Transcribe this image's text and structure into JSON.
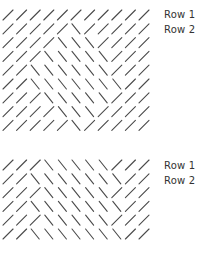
{
  "stroke_color": "#4a4a4a",
  "grids": [
    {
      "name": "top-grid",
      "top": 8,
      "rows": [
        "///////////",
        "/////\\/////",
        "////\\\\\\////",
        "///\\\\\\\\\\///",
        "//\\\\\\\\\\\\///",
        "//\\\\\\\\\\\\\\//",
        "///\\\\\\\\\\///",
        "////\\\\\\////",
        "/////\\/////"
      ],
      "labels": [
        {
          "text": "Row 1",
          "row": 0
        },
        {
          "text": "Row 2",
          "row": 1
        }
      ]
    },
    {
      "name": "bottom-grid",
      "top": 158,
      "rows": [
        "///\\\\\\\\\\///",
        "//\\\\\\\\\\\\\\//",
        "///\\\\\\\\\\///",
        "//\\\\\\\\\\\\\\//",
        "///\\\\\\\\\\///",
        "//\\\\\\\\\\\\\\//"
      ],
      "labels": [
        {
          "text": "Row 1",
          "row": 0
        },
        {
          "text": "Row 2",
          "row": 1
        }
      ]
    }
  ],
  "layout": {
    "col_start": 8,
    "col_step": 13.6,
    "row_step": 13.8,
    "stroke_len": 10
  }
}
